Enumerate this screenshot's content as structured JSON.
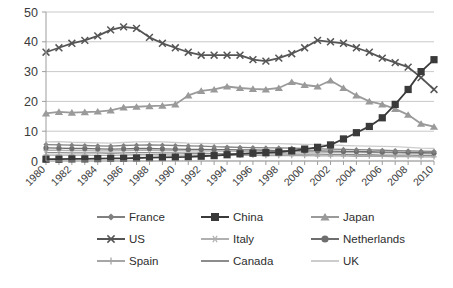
{
  "chart_data": {
    "type": "line",
    "title": "",
    "xlabel": "",
    "ylabel": "",
    "ylim": [
      0,
      50
    ],
    "yticks": [
      0,
      10,
      20,
      30,
      40,
      50
    ],
    "grid": true,
    "legend_position": "bottom",
    "x": [
      1980,
      1981,
      1982,
      1983,
      1984,
      1985,
      1986,
      1987,
      1988,
      1989,
      1990,
      1991,
      1992,
      1993,
      1994,
      1995,
      1996,
      1997,
      1998,
      1999,
      2000,
      2001,
      2002,
      2003,
      2004,
      2005,
      2006,
      2007,
      2008,
      2009,
      2010
    ],
    "xtick_labels": [
      "1980",
      "1982",
      "1984",
      "1986",
      "1988",
      "1990",
      "1992",
      "1994",
      "1996",
      "1998",
      "2000",
      "2002",
      "2004",
      "2006",
      "2008",
      "2010"
    ],
    "series": [
      {
        "name": "France",
        "marker": "diamond",
        "color": "#808080",
        "values": [
          5.5,
          5.4,
          5.3,
          5.2,
          5.1,
          5.0,
          5.2,
          5.3,
          5.4,
          5.3,
          5.2,
          5.1,
          5.0,
          4.8,
          4.7,
          4.6,
          4.5,
          4.4,
          4.4,
          4.3,
          4.2,
          4.1,
          4.0,
          3.9,
          3.8,
          3.7,
          3.6,
          3.5,
          3.4,
          3.3,
          3.2
        ]
      },
      {
        "name": "China",
        "marker": "square",
        "color": "#3a3a3a",
        "values": [
          0.6,
          0.6,
          0.7,
          0.7,
          0.8,
          0.9,
          0.9,
          1.0,
          1.1,
          1.2,
          1.3,
          1.4,
          1.6,
          1.8,
          2.1,
          2.4,
          2.6,
          2.8,
          3.0,
          3.4,
          4.0,
          4.6,
          5.4,
          7.4,
          9.5,
          11.6,
          14.5,
          19.0,
          24.0,
          30.0,
          34.0
        ]
      },
      {
        "name": "Japan",
        "marker": "triangle",
        "color": "#9a9a9a",
        "values": [
          16.0,
          16.5,
          16.2,
          16.4,
          16.6,
          17.0,
          18.0,
          18.2,
          18.4,
          18.6,
          19.0,
          22.0,
          23.5,
          24.0,
          25.0,
          24.5,
          24.2,
          24.0,
          24.5,
          26.5,
          25.5,
          25.0,
          27.0,
          24.5,
          22.0,
          20.0,
          19.0,
          17.5,
          15.5,
          12.5,
          11.5
        ]
      },
      {
        "name": "US",
        "marker": "cross",
        "color": "#555555",
        "values": [
          36.5,
          38.0,
          39.5,
          40.5,
          42.0,
          44.0,
          45.0,
          44.5,
          41.5,
          39.5,
          38.0,
          36.5,
          35.5,
          35.5,
          35.5,
          35.5,
          34.0,
          33.5,
          34.5,
          36.0,
          38.0,
          40.5,
          40.0,
          39.5,
          38.0,
          36.5,
          34.5,
          33.0,
          31.5,
          28.0,
          24.0
        ]
      },
      {
        "name": "Italy",
        "marker": "asterisk",
        "color": "#b0b0b0",
        "values": [
          3.6,
          3.6,
          3.5,
          3.5,
          3.4,
          3.4,
          3.5,
          3.6,
          3.6,
          3.5,
          3.5,
          3.4,
          3.4,
          3.3,
          3.3,
          3.2,
          3.2,
          3.2,
          3.1,
          3.1,
          3.0,
          3.0,
          2.9,
          2.9,
          2.8,
          2.8,
          2.7,
          2.7,
          2.6,
          2.5,
          2.5
        ]
      },
      {
        "name": "Netherlands",
        "marker": "circle",
        "color": "#6e6e6e",
        "values": [
          4.4,
          4.3,
          4.2,
          4.2,
          4.1,
          4.0,
          4.1,
          4.2,
          4.2,
          4.1,
          4.0,
          3.9,
          3.9,
          3.8,
          3.8,
          3.7,
          3.7,
          3.6,
          3.5,
          3.5,
          3.4,
          3.4,
          3.3,
          3.2,
          3.2,
          3.1,
          3.0,
          3.0,
          2.9,
          2.8,
          2.7
        ]
      },
      {
        "name": "Spain",
        "marker": "plus",
        "color": "#a6a6a6",
        "values": [
          2.0,
          2.0,
          2.0,
          2.0,
          1.9,
          1.9,
          2.0,
          2.1,
          2.1,
          2.1,
          2.0,
          2.0,
          2.0,
          1.9,
          1.9,
          1.9,
          1.9,
          1.8,
          1.8,
          1.8,
          1.8,
          1.7,
          1.7,
          1.7,
          1.6,
          1.6,
          1.6,
          1.5,
          1.5,
          1.4,
          1.4
        ]
      },
      {
        "name": "Canada",
        "marker": "none",
        "color": "#8c8c8c",
        "values": [
          2.8,
          2.8,
          2.7,
          2.7,
          2.7,
          2.6,
          2.7,
          2.8,
          2.8,
          2.7,
          2.7,
          2.6,
          2.6,
          2.5,
          2.5,
          2.5,
          2.4,
          2.4,
          2.4,
          2.3,
          2.3,
          2.3,
          2.2,
          2.2,
          2.1,
          2.1,
          2.0,
          2.0,
          2.0,
          1.9,
          1.9
        ]
      },
      {
        "name": "UK",
        "marker": "none",
        "color": "#cccccc",
        "values": [
          6.4,
          6.5,
          6.3,
          6.2,
          6.1,
          6.0,
          6.2,
          6.4,
          6.5,
          6.4,
          6.2,
          6.0,
          5.9,
          5.8,
          5.9,
          6.0,
          5.9,
          5.8,
          5.8,
          5.7,
          5.6,
          5.5,
          5.4,
          5.2,
          5.1,
          5.0,
          4.9,
          4.8,
          4.6,
          4.3,
          4.2
        ]
      }
    ]
  },
  "legend": {
    "rows": [
      [
        {
          "label": "France",
          "marker": "diamond",
          "color": "#808080"
        },
        {
          "label": "China",
          "marker": "square",
          "color": "#3a3a3a"
        },
        {
          "label": "Japan",
          "marker": "triangle",
          "color": "#9a9a9a"
        }
      ],
      [
        {
          "label": "US",
          "marker": "cross",
          "color": "#555555"
        },
        {
          "label": "Italy",
          "marker": "asterisk",
          "color": "#b0b0b0"
        },
        {
          "label": "Netherlands",
          "marker": "circle",
          "color": "#6e6e6e"
        }
      ],
      [
        {
          "label": "Spain",
          "marker": "plus",
          "color": "#a6a6a6"
        },
        {
          "label": "Canada",
          "marker": "none",
          "color": "#8c8c8c"
        },
        {
          "label": "UK",
          "marker": "none",
          "color": "#cccccc"
        }
      ]
    ]
  },
  "axes": {
    "y_tick_labels": [
      "0",
      "10",
      "20",
      "30",
      "40",
      "50"
    ],
    "grid_color": "#c9c9c9",
    "axis_color": "#9d9d9d",
    "background": "#ffffff"
  }
}
